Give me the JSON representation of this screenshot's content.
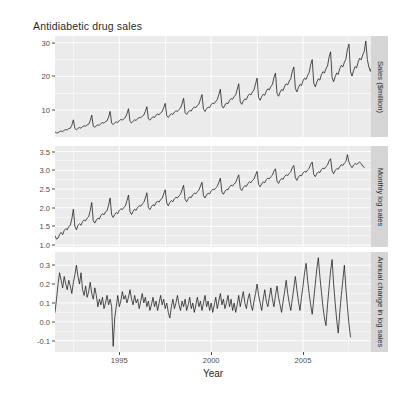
{
  "chart_data": {
    "type": "line",
    "title": "Antidiabetic drug sales",
    "xlabel": "Year",
    "ylabel": "",
    "grid": true,
    "legend": false,
    "facet_direction": "vertical",
    "x": {
      "label": "Year",
      "ticks": [
        "1995",
        "2000",
        "2005"
      ],
      "tick_values": [
        1995,
        2000,
        2005
      ],
      "range": [
        1991.5,
        2008.7
      ]
    },
    "panels": [
      {
        "strip_label": "Sales ($million)",
        "ylim": [
          2.0,
          32.0
        ],
        "yticks": [
          "10",
          "20",
          "30"
        ],
        "ytick_values": [
          10,
          20,
          30
        ],
        "series_name": "Monthly antidiabetic drug sales",
        "description": "Monthly totals of scripts for antidiabetic drugs in Australia, strong upward trend with growing seasonal spikes each January.",
        "values": [
          3.5,
          3.2,
          3.3,
          3.6,
          3.8,
          3.6,
          4.0,
          4.2,
          4.1,
          4.5,
          4.6,
          5.5,
          7.1,
          4.5,
          4.1,
          4.6,
          4.8,
          4.6,
          5.1,
          5.3,
          5.2,
          5.6,
          5.8,
          6.8,
          8.5,
          5.2,
          4.9,
          5.3,
          5.6,
          5.5,
          6.0,
          6.3,
          6.1,
          6.6,
          6.8,
          7.9,
          9.6,
          6.1,
          5.7,
          6.2,
          6.5,
          6.3,
          6.9,
          7.2,
          7.0,
          7.5,
          7.8,
          8.9,
          10.4,
          6.6,
          6.2,
          6.7,
          7.1,
          6.9,
          7.5,
          7.8,
          7.7,
          8.2,
          8.5,
          9.6,
          11.0,
          7.4,
          7.0,
          7.6,
          8.0,
          7.8,
          8.5,
          8.8,
          8.6,
          9.2,
          9.5,
          10.7,
          12.0,
          8.3,
          7.8,
          8.5,
          8.9,
          8.7,
          9.4,
          9.8,
          9.6,
          10.2,
          10.6,
          11.9,
          13.5,
          9.2,
          8.7,
          9.4,
          9.9,
          9.7,
          10.5,
          10.9,
          10.7,
          11.4,
          11.8,
          13.2,
          14.6,
          10.2,
          9.6,
          10.4,
          10.9,
          10.7,
          11.6,
          12.1,
          11.9,
          12.6,
          13.1,
          14.6,
          16.2,
          11.3,
          10.6,
          11.5,
          12.1,
          11.9,
          12.9,
          13.4,
          13.2,
          14.0,
          14.5,
          16.1,
          17.8,
          12.4,
          11.7,
          12.7,
          13.3,
          13.1,
          14.2,
          14.8,
          14.5,
          15.4,
          16.0,
          17.8,
          19.5,
          13.7,
          12.9,
          14.0,
          14.7,
          14.4,
          15.6,
          16.3,
          16.0,
          17.0,
          17.6,
          19.6,
          21.0,
          15.0,
          14.1,
          15.3,
          16.1,
          15.8,
          17.1,
          17.8,
          17.5,
          18.6,
          19.3,
          21.5,
          22.8,
          16.4,
          15.4,
          16.7,
          17.6,
          17.3,
          18.7,
          19.5,
          19.1,
          20.3,
          21.1,
          23.5,
          25.0,
          18.0,
          16.9,
          18.3,
          19.3,
          18.9,
          20.5,
          21.4,
          21.0,
          22.3,
          23.1,
          25.7,
          27.3,
          19.6,
          18.4,
          19.9,
          21.0,
          20.6,
          22.3,
          23.3,
          22.8,
          24.2,
          25.1,
          28.0,
          29.6,
          21.4,
          20.1,
          21.7,
          22.9,
          22.5,
          24.3,
          25.4,
          24.9,
          26.4,
          27.4,
          30.5,
          25.0,
          22.8,
          21.5,
          23.0,
          24.0,
          23.5,
          24.2,
          25.0,
          24.0,
          22.5,
          21.8
        ]
      },
      {
        "strip_label": "Monthly log sales",
        "ylim": [
          0.95,
          3.65
        ],
        "yticks": [
          "1.0",
          "1.5",
          "2.0",
          "2.5",
          "3.0",
          "3.5"
        ],
        "ytick_values": [
          1.0,
          1.5,
          2.0,
          2.5,
          3.0,
          3.5
        ],
        "series_name": "Log of monthly sales",
        "description": "Natural logarithm of the sales series; trend is close to linear and the seasonal variation is stabilised.",
        "values": [
          1.25,
          1.16,
          1.19,
          1.28,
          1.34,
          1.28,
          1.39,
          1.44,
          1.41,
          1.5,
          1.53,
          1.7,
          1.96,
          1.5,
          1.41,
          1.53,
          1.57,
          1.53,
          1.63,
          1.67,
          1.65,
          1.72,
          1.76,
          1.92,
          2.14,
          1.65,
          1.59,
          1.67,
          1.72,
          1.7,
          1.79,
          1.84,
          1.81,
          1.89,
          1.92,
          2.07,
          2.26,
          1.81,
          1.74,
          1.82,
          1.87,
          1.84,
          1.93,
          1.97,
          1.95,
          2.01,
          2.05,
          2.19,
          2.34,
          1.89,
          1.82,
          1.9,
          1.96,
          1.93,
          2.01,
          2.05,
          2.04,
          2.1,
          2.14,
          2.26,
          2.4,
          2.0,
          1.95,
          2.03,
          2.08,
          2.05,
          2.14,
          2.17,
          2.15,
          2.22,
          2.25,
          2.37,
          2.48,
          2.12,
          2.05,
          2.14,
          2.19,
          2.16,
          2.24,
          2.28,
          2.26,
          2.32,
          2.36,
          2.48,
          2.6,
          2.22,
          2.16,
          2.24,
          2.29,
          2.27,
          2.35,
          2.39,
          2.37,
          2.43,
          2.47,
          2.58,
          2.68,
          2.32,
          2.26,
          2.34,
          2.39,
          2.37,
          2.45,
          2.49,
          2.48,
          2.53,
          2.57,
          2.68,
          2.79,
          2.42,
          2.36,
          2.44,
          2.49,
          2.48,
          2.56,
          2.6,
          2.58,
          2.64,
          2.67,
          2.78,
          2.88,
          2.52,
          2.46,
          2.54,
          2.59,
          2.57,
          2.65,
          2.69,
          2.67,
          2.73,
          2.77,
          2.88,
          2.97,
          2.62,
          2.56,
          2.64,
          2.69,
          2.67,
          2.75,
          2.79,
          2.77,
          2.83,
          2.87,
          2.98,
          3.04,
          2.71,
          2.65,
          2.73,
          2.78,
          2.76,
          2.84,
          2.88,
          2.86,
          2.92,
          2.96,
          3.07,
          3.13,
          2.8,
          2.73,
          2.82,
          2.87,
          2.85,
          2.93,
          2.97,
          2.95,
          3.01,
          3.05,
          3.16,
          3.22,
          2.89,
          2.83,
          2.91,
          2.96,
          2.94,
          3.02,
          3.06,
          3.04,
          3.1,
          3.14,
          3.25,
          3.31,
          2.98,
          2.91,
          3.0,
          3.04,
          3.03,
          3.1,
          3.15,
          3.13,
          3.19,
          3.23,
          3.42,
          3.22,
          3.13,
          3.07,
          3.14,
          3.18,
          3.16,
          3.19,
          3.22,
          3.18,
          3.11,
          3.08
        ]
      },
      {
        "strip_label": "Annual change in log sales",
        "ylim": [
          -0.16,
          0.37
        ],
        "yticks": [
          "-0.1",
          "0.0",
          "0.1",
          "0.2",
          "0.3"
        ],
        "ytick_values": [
          -0.1,
          0.0,
          0.1,
          0.2,
          0.3
        ],
        "series_name": "Annual change in log sales",
        "description": "Twelfth difference of the log series: noisy fluctuation around 0.1 with a sharp negative outlier near 1995 and a sharp drop at the end.",
        "values": [
          0.05,
          0.12,
          0.2,
          0.26,
          0.22,
          0.18,
          0.24,
          0.2,
          0.17,
          0.22,
          0.19,
          0.15,
          0.21,
          0.25,
          0.3,
          0.24,
          0.2,
          0.26,
          0.17,
          0.14,
          0.19,
          0.13,
          0.16,
          0.21,
          0.15,
          0.12,
          0.18,
          0.14,
          0.08,
          0.12,
          0.09,
          0.13,
          0.07,
          0.1,
          0.14,
          0.09,
          0.12,
          0.08,
          -0.13,
          0.02,
          0.08,
          0.14,
          0.08,
          0.11,
          0.16,
          0.12,
          0.14,
          0.1,
          0.13,
          0.17,
          0.12,
          0.09,
          0.14,
          0.1,
          0.12,
          0.07,
          0.11,
          0.15,
          0.1,
          0.13,
          0.08,
          0.11,
          0.06,
          0.09,
          0.13,
          0.08,
          0.11,
          0.06,
          0.1,
          0.14,
          0.09,
          0.12,
          0.07,
          0.1,
          0.05,
          0.02,
          0.08,
          0.12,
          0.07,
          0.1,
          0.14,
          0.09,
          0.06,
          0.11,
          0.08,
          0.12,
          0.06,
          0.09,
          0.13,
          0.07,
          0.1,
          0.05,
          0.09,
          0.13,
          0.08,
          0.11,
          0.06,
          0.1,
          0.14,
          0.08,
          0.11,
          0.06,
          0.1,
          0.05,
          0.09,
          0.13,
          0.07,
          0.11,
          0.15,
          0.09,
          0.12,
          0.07,
          0.1,
          0.14,
          0.08,
          0.12,
          0.06,
          0.1,
          0.05,
          0.09,
          0.14,
          0.08,
          0.12,
          0.16,
          0.1,
          0.07,
          0.12,
          0.15,
          0.09,
          0.06,
          0.11,
          0.15,
          0.2,
          0.14,
          0.1,
          0.06,
          0.12,
          0.17,
          0.11,
          0.08,
          0.13,
          0.18,
          0.12,
          0.08,
          0.14,
          0.19,
          0.13,
          0.09,
          0.05,
          0.11,
          0.16,
          0.22,
          0.15,
          0.1,
          0.06,
          0.12,
          0.18,
          0.24,
          0.17,
          0.11,
          0.06,
          0.13,
          0.19,
          0.26,
          0.31,
          0.22,
          0.15,
          0.09,
          0.04,
          0.12,
          0.2,
          0.28,
          0.34,
          0.24,
          0.16,
          0.08,
          0.02,
          -0.02,
          0.09,
          0.18,
          0.27,
          0.33,
          0.2,
          0.1,
          0.01,
          -0.06,
          0.05,
          0.14,
          0.22,
          0.3,
          0.18,
          0.08,
          -0.01,
          -0.08
        ]
      }
    ]
  }
}
